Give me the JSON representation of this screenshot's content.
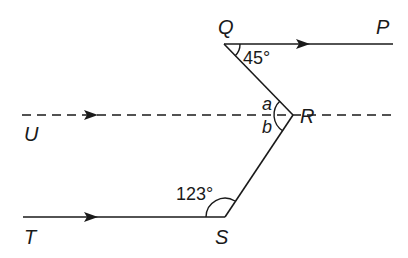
{
  "diagram": {
    "type": "geometry-parallel-lines",
    "points": {
      "Q": {
        "label": "Q"
      },
      "P": {
        "label": "P"
      },
      "R": {
        "label": "R"
      },
      "U": {
        "label": "U"
      },
      "S": {
        "label": "S"
      },
      "T": {
        "label": "T"
      }
    },
    "angles": {
      "angle_Q": "45°",
      "angle_S": "123°",
      "angle_a": "a",
      "angle_b": "b"
    },
    "lines": [
      {
        "name": "QP",
        "style": "solid",
        "arrow": "right"
      },
      {
        "name": "UR",
        "style": "dashed",
        "arrow": "right"
      },
      {
        "name": "TS",
        "style": "solid",
        "arrow": "right"
      },
      {
        "name": "QR",
        "style": "solid"
      },
      {
        "name": "RS",
        "style": "solid"
      }
    ]
  }
}
